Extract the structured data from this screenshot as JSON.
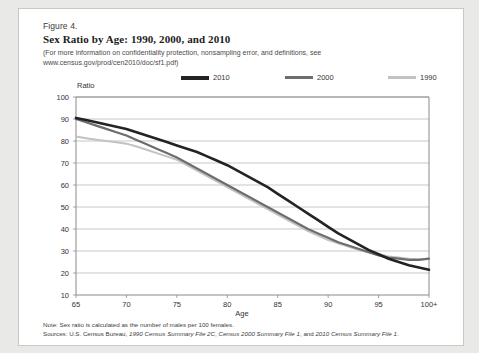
{
  "figure": {
    "number": "Figure 4.",
    "title": "Sex Ratio by Age: 1990, 2000, and 2010",
    "subtitle_line1": "(For more information on confidentiality protection, nonsampling error, and definitions, see",
    "subtitle_line2": "www.census.gov/prod/cen2010/doc/sf1.pdf)",
    "note": "Note: Sex ratio is calculated as the number of males per 100 females.",
    "sources": "Sources: U.S. Census Bureau, 1990 Census Summary File 2C, Census 2000 Summary File 1, and 2010 Census Summary File 1."
  },
  "colors": {
    "series_2010": "#232323",
    "series_2000": "#6d6d6d",
    "series_1990": "#c2c2c2",
    "gridline": "#b9b9b9",
    "axis": "#8a8a8a",
    "card_bg": "#ffffff",
    "page_bg": "#e9e9e7"
  },
  "chart_data": {
    "type": "line",
    "title": "Sex Ratio by Age: 1990, 2000, and 2010",
    "xlabel": "Age",
    "ylabel": "Ratio",
    "xlim": [
      65,
      100
    ],
    "ylim": [
      10,
      100
    ],
    "yticks": [
      100,
      90,
      80,
      70,
      60,
      50,
      40,
      30,
      20,
      10
    ],
    "xticks": [
      65,
      70,
      75,
      80,
      85,
      90,
      95,
      100
    ],
    "xtick_labels": [
      "65",
      "70",
      "75",
      "80",
      "85",
      "90",
      "95",
      "100+"
    ],
    "grid": true,
    "legend_position": "top",
    "x": [
      65,
      66,
      67,
      68,
      69,
      70,
      71,
      72,
      73,
      74,
      75,
      76,
      77,
      78,
      79,
      80,
      81,
      82,
      83,
      84,
      85,
      86,
      87,
      88,
      89,
      90,
      91,
      92,
      93,
      94,
      95,
      96,
      97,
      98,
      99,
      100
    ],
    "series": [
      {
        "name": "2010",
        "color": "#232323",
        "values": [
          90.5,
          89.5,
          88.5,
          87.5,
          86.5,
          85.5,
          84.0,
          82.5,
          81.0,
          79.5,
          78.0,
          76.5,
          75.0,
          73.0,
          71.0,
          69.0,
          66.5,
          64.0,
          61.5,
          59.0,
          56.0,
          53.0,
          50.0,
          47.0,
          44.0,
          41.0,
          38.0,
          35.5,
          33.0,
          30.5,
          28.5,
          26.5,
          25.0,
          23.5,
          22.5,
          21.5
        ]
      },
      {
        "name": "2000",
        "color": "#6d6d6d",
        "values": [
          90.0,
          88.5,
          87.0,
          85.5,
          84.0,
          82.5,
          80.5,
          78.5,
          76.5,
          74.5,
          72.5,
          70.0,
          67.5,
          65.0,
          62.5,
          60.0,
          57.5,
          55.0,
          52.5,
          50.0,
          47.5,
          45.0,
          42.5,
          40.0,
          38.0,
          36.0,
          34.0,
          32.5,
          31.0,
          29.5,
          28.0,
          27.0,
          26.5,
          26.0,
          26.0,
          26.5
        ]
      },
      {
        "name": "1990",
        "color": "#c2c2c2",
        "values": [
          82.0,
          81.3,
          80.6,
          80.0,
          79.4,
          78.8,
          77.5,
          76.0,
          74.5,
          73.0,
          71.5,
          69.0,
          66.5,
          64.0,
          61.5,
          59.0,
          56.5,
          54.0,
          51.5,
          49.0,
          46.5,
          44.0,
          41.5,
          39.0,
          37.0,
          35.0,
          33.5,
          32.0,
          30.5,
          29.5,
          28.5,
          27.5,
          27.0,
          26.5,
          26.3,
          26.5
        ]
      }
    ]
  },
  "legend": {
    "items": [
      {
        "label": "2010"
      },
      {
        "label": "2000"
      },
      {
        "label": "1990"
      }
    ]
  }
}
